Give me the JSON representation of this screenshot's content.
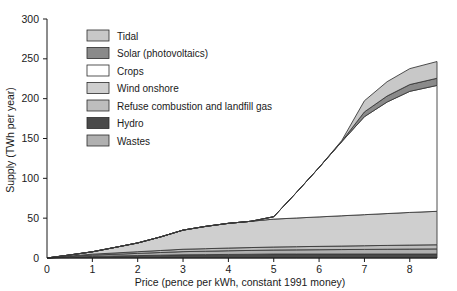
{
  "chart_data": {
    "type": "area",
    "title": "",
    "xlabel": "Price (pence per kWh, constant 1991 money)",
    "ylabel": "Supply (TWh per year)",
    "xlim": [
      0,
      8.6
    ],
    "ylim": [
      0,
      300
    ],
    "xticks": [
      0,
      1,
      2,
      3,
      4,
      5,
      6,
      7,
      8
    ],
    "yticks": [
      0,
      50,
      100,
      150,
      200,
      250,
      300
    ],
    "xtick_labels": [
      "0",
      "1",
      "2",
      "3",
      "4",
      "5",
      "6",
      "7",
      "8"
    ],
    "ytick_labels": [
      "0",
      "50",
      "100",
      "150",
      "200",
      "250",
      "300"
    ],
    "grid": false,
    "legend_position": "upper-left-inside",
    "stacked": true,
    "stack_order_bottom_to_top": [
      "Hydro",
      "Wastes",
      "Refuse combustion and landfill gas",
      "Wind onshore",
      "Crops",
      "Solar (photovoltaics)",
      "Tidal"
    ],
    "x": [
      0,
      0.5,
      1,
      1.5,
      2,
      2.5,
      3,
      3.5,
      4,
      4.5,
      5,
      5.5,
      6,
      6.5,
      7,
      7.5,
      8,
      8.6
    ],
    "series": [
      {
        "name": "Hydro",
        "color": "#4a4a4a",
        "values": [
          0,
          1,
          2,
          2.5,
          3,
          3.5,
          4,
          4.2,
          4.5,
          4.7,
          5,
          5,
          5,
          5,
          5,
          5,
          5,
          5
        ]
      },
      {
        "name": "Wastes",
        "color": "#b0b0b0",
        "values": [
          0,
          0.8,
          1.6,
          2.2,
          2.8,
          3.4,
          4,
          4.3,
          4.6,
          4.8,
          5,
          5.2,
          5.4,
          5.6,
          5.8,
          6,
          6.2,
          6.4
        ]
      },
      {
        "name": "Refuse combustion and landfill gas",
        "color": "#bdbdbd",
        "values": [
          0,
          0.6,
          1.2,
          1.6,
          2.1,
          2.5,
          3,
          3.2,
          3.4,
          3.6,
          3.8,
          4,
          4.2,
          4.4,
          4.6,
          4.8,
          5,
          5.2
        ]
      },
      {
        "name": "Wind onshore",
        "color": "#cfcfcf",
        "values": [
          0,
          1.4,
          3,
          7,
          11,
          17,
          24,
          28,
          31,
          33,
          35,
          36,
          37,
          38,
          39,
          40,
          41,
          42
        ]
      },
      {
        "name": "Crops",
        "color": "#ffffff",
        "values": [
          0,
          0,
          0,
          0,
          0,
          0,
          0,
          0,
          0,
          0,
          3,
          32,
          62,
          93,
          123,
          140,
          152,
          158
        ]
      },
      {
        "name": "Solar (photovoltaics)",
        "color": "#8a8a8a",
        "values": [
          0,
          0,
          0,
          0,
          0,
          0,
          0,
          0,
          0,
          0,
          0,
          0,
          0,
          0.5,
          6,
          7.5,
          8.5,
          9
        ]
      },
      {
        "name": "Tidal",
        "color": "#c8c8c8",
        "values": [
          0,
          0,
          0,
          0,
          0,
          0,
          0,
          0,
          0,
          0,
          0,
          0,
          0,
          1,
          14,
          18,
          20,
          21
        ]
      }
    ]
  },
  "axes": {
    "y_title": "Supply (TWh per year)",
    "x_title": "Price (pence per kWh, constant 1991 money)",
    "y_tick_labels": [
      "300",
      "250",
      "200",
      "150",
      "100",
      "50",
      "0"
    ],
    "x_tick_labels": [
      "0",
      "1",
      "2",
      "3",
      "4",
      "5",
      "6",
      "7",
      "8"
    ]
  },
  "legend": {
    "items": [
      {
        "label": "Tidal",
        "color": "#c8c8c8"
      },
      {
        "label": "Solar (photovoltaics)",
        "color": "#8a8a8a"
      },
      {
        "label": "Crops",
        "color": "#ffffff"
      },
      {
        "label": "Wind onshore",
        "color": "#cfcfcf"
      },
      {
        "label": "Refuse combustion and landfill gas",
        "color": "#bdbdbd"
      },
      {
        "label": "Hydro",
        "color": "#4a4a4a"
      },
      {
        "label": "Wastes",
        "color": "#b0b0b0"
      }
    ]
  }
}
